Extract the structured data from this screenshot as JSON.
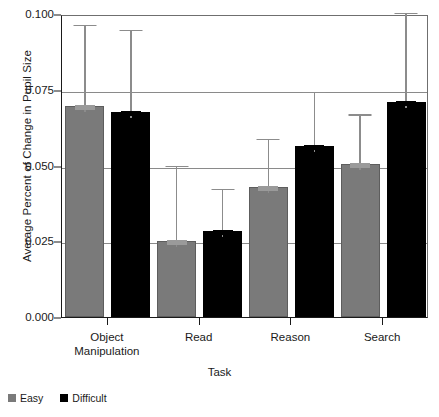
{
  "chart_data": {
    "type": "bar",
    "title": "",
    "xlabel": "Task",
    "ylabel": "Average Percent of Change in Pupil Size",
    "categories": [
      "Object Manipulation",
      "Read",
      "Reason",
      "Search"
    ],
    "category_lines": [
      [
        "Object",
        "Manipulation"
      ],
      [
        "Read"
      ],
      [
        "Reason"
      ],
      [
        "Search"
      ]
    ],
    "series": [
      {
        "name": "Easy",
        "color": "#7a7a7a",
        "values": [
          0.0695,
          0.025,
          0.043,
          0.0505
        ],
        "error_upper": [
          0.097,
          0.0505,
          0.0595,
          0.0675
        ]
      },
      {
        "name": "Difficult",
        "color": "#000000",
        "values": [
          0.0675,
          0.0285,
          0.0565,
          0.071
        ],
        "error_upper": [
          0.0955,
          0.043,
          0.075,
          0.101
        ]
      }
    ],
    "ylim": [
      0.0,
      0.1
    ],
    "yticks": [
      0.0,
      0.025,
      0.05,
      0.075,
      0.1
    ],
    "ytick_labels": [
      "0.000",
      "0.025",
      "0.050",
      "0.075",
      "0.100"
    ],
    "grid": true,
    "grid_axis": "y",
    "legend": [
      "Easy",
      "Difficult"
    ],
    "legend_position": "bottom-left",
    "error_bar_style": "upper-whisker-only"
  }
}
